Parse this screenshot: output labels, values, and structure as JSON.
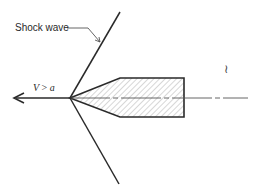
{
  "diagram": {
    "labels": {
      "shock_wave": "Shock wave",
      "velocity_var": "V",
      "velocity_op": " > ",
      "velocity_sound": "a",
      "margin_mark": "≀"
    },
    "colors": {
      "line": "#2a2a2a",
      "hatch": "#9a9a9a",
      "background": "#ffffff"
    },
    "geometry": {
      "vertex": [
        70,
        98
      ],
      "shock_upper_end": [
        120,
        12
      ],
      "shock_lower_end": [
        119,
        184
      ],
      "body_cone_top": [
        120,
        78
      ],
      "body_cone_bottom": [
        120,
        117
      ],
      "body_rect": {
        "x1": 120,
        "x2": 184,
        "y1": 78,
        "y2": 117
      },
      "axis_line_end_x": 248,
      "arrow_tip_x": 14
    }
  }
}
